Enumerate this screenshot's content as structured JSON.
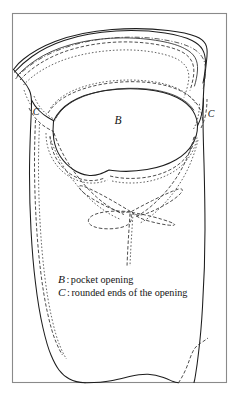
{
  "figure": {
    "kind": "technical-line-drawing",
    "title": "",
    "frame": {
      "x": 12,
      "y": 13,
      "width": 215,
      "height": 370,
      "stroke_color": "#8a8a8a"
    },
    "background_color": "#ffffff",
    "ink_color": "#1d1d1d"
  },
  "labels": {
    "b": "B",
    "c_left": "C",
    "c_right": "C"
  },
  "legend": {
    "entries": [
      {
        "symbol": "B",
        "separator": ":",
        "description": "pocket opening"
      },
      {
        "symbol": "C",
        "separator": ":",
        "description": "rounded ends of the opening"
      }
    ]
  },
  "line_styles": {
    "solid": "solid outline",
    "dashed": "dashed outline",
    "dotted": "dotted outline",
    "dashdot": "dash-dot outline"
  }
}
